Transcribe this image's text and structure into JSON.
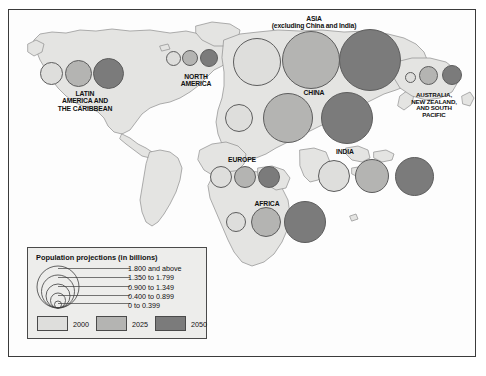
{
  "chart_data": {
    "type": "bubble-map",
    "title": "Population projections (in billions)",
    "units": "billions",
    "years": [
      "2000",
      "2025",
      "2050"
    ],
    "size_classes": [
      "1.800 and above",
      "1.350 to 1.799",
      "0.900 to 1.349",
      "0.400 to 0.899",
      "0 to 0.399"
    ],
    "colors": {
      "y2000": "#dededc",
      "y2025": "#b4b4b2",
      "y2050": "#7b7b7b",
      "land": "#e4e4e2",
      "ocean": "#fbfbfb",
      "outline": "#6f6f6f",
      "frame": "#3b3b3b",
      "legend_bg": "#ededeb"
    },
    "regions": [
      {
        "name": "LATIN\nAMERICA AND\nTHE CARIBBEAN",
        "label_x": 85,
        "label_y": 90,
        "values": [
          0.52,
          0.7,
          0.81
        ],
        "bubbles": [
          {
            "year": "2000",
            "cx": 51,
            "cy": 73,
            "r": 11.5
          },
          {
            "year": "2025",
            "cx": 78,
            "cy": 73,
            "r": 13.5
          },
          {
            "year": "2050",
            "cx": 108,
            "cy": 73,
            "r": 15.5
          }
        ]
      },
      {
        "name": "NORTH\nAMERICA",
        "label_x": 196,
        "label_y": 73,
        "values": [
          0.31,
          0.38,
          0.44
        ],
        "bubbles": [
          {
            "year": "2000",
            "cx": 173,
            "cy": 58,
            "r": 7.5
          },
          {
            "year": "2025",
            "cx": 190,
            "cy": 58,
            "r": 8.2
          },
          {
            "year": "2050",
            "cx": 209,
            "cy": 58,
            "r": 9.2
          }
        ]
      },
      {
        "name": "ASIA\n(excluding China and India)",
        "label_x": 314,
        "label_y": 15,
        "values": [
          1.67,
          2.32,
          2.58
        ],
        "bubbles": [
          {
            "year": "2000",
            "cx": 257,
            "cy": 62,
            "r": 24
          },
          {
            "year": "2025",
            "cx": 311,
            "cy": 60,
            "r": 29
          },
          {
            "year": "2050",
            "cx": 370,
            "cy": 60,
            "r": 31
          }
        ]
      },
      {
        "name": "CHINA",
        "label_x": 314,
        "label_y": 89,
        "values": [
          1.27,
          1.47,
          1.39
        ],
        "bubbles": [
          {
            "year": "2000",
            "cx": 239,
            "cy": 118,
            "r": 14
          },
          {
            "year": "2025",
            "cx": 288,
            "cy": 118,
            "r": 25
          },
          {
            "year": "2050",
            "cx": 347,
            "cy": 118,
            "r": 26
          }
        ]
      },
      {
        "name": "INDIA",
        "label_x": 345,
        "label_y": 148,
        "values": [
          1.01,
          1.39,
          1.57
        ],
        "bubbles": [
          {
            "year": "2000",
            "cx": 334,
            "cy": 176,
            "r": 16
          },
          {
            "year": "2025",
            "cx": 372,
            "cy": 176,
            "r": 17
          },
          {
            "year": "2050",
            "cx": 414,
            "cy": 176,
            "r": 19.5
          }
        ]
      },
      {
        "name": "EUROPE",
        "label_x": 242,
        "label_y": 156,
        "values": [
          0.72,
          0.7,
          0.63
        ],
        "bubbles": [
          {
            "year": "2000",
            "cx": 221,
            "cy": 177,
            "r": 11
          },
          {
            "year": "2025",
            "cx": 245,
            "cy": 177,
            "r": 11
          },
          {
            "year": "2050",
            "cx": 269,
            "cy": 177,
            "r": 11
          }
        ]
      },
      {
        "name": "AFRICA",
        "label_x": 267,
        "label_y": 200,
        "values": [
          0.8,
          1.4,
          1.8
        ],
        "bubbles": [
          {
            "year": "2000",
            "cx": 236,
            "cy": 222,
            "r": 10
          },
          {
            "year": "2025",
            "cx": 266,
            "cy": 222,
            "r": 15
          },
          {
            "year": "2050",
            "cx": 305,
            "cy": 222,
            "r": 21
          }
        ]
      },
      {
        "name": "AUSTRALIA,\nNEW ZEALAND,\nAND SOUTH\nPACIFIC",
        "label_x": 434,
        "label_y": 92,
        "values": [
          0.03,
          0.04,
          0.05
        ],
        "bubbles": [
          {
            "year": "2000",
            "cx": 410,
            "cy": 77,
            "r": 5.5
          },
          {
            "year": "2025",
            "cx": 428,
            "cy": 75,
            "r": 9.5
          },
          {
            "year": "2050",
            "cx": 452,
            "cy": 75,
            "r": 10
          }
        ]
      }
    ],
    "legend": {
      "title": "Population projections (in billions)",
      "size_rows": [
        {
          "label": "1.800 and above",
          "r": 21
        },
        {
          "label": "1.350 to 1.799",
          "r": 16.5
        },
        {
          "label": "0.900 to 1.349",
          "r": 12
        },
        {
          "label": "0.400 to 0.899",
          "r": 7.5
        },
        {
          "label": "0 to 0.399",
          "r": 3.5
        }
      ],
      "swatches": [
        {
          "year": "2000",
          "color": "#dededc"
        },
        {
          "year": "2025",
          "color": "#b4b4b2"
        },
        {
          "year": "2050",
          "color": "#7b7b7b"
        }
      ]
    }
  }
}
